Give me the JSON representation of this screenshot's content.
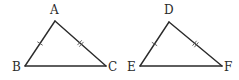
{
  "diagram": {
    "stroke_color": "#2a2a2a",
    "triangles": [
      {
        "name": "ABC",
        "vertices": [
          "A",
          "B",
          "C"
        ],
        "sides": [
          {
            "from": "A",
            "to": "B",
            "tick_marks": 1
          },
          {
            "from": "A",
            "to": "C",
            "tick_marks": 2
          },
          {
            "from": "B",
            "to": "C",
            "tick_marks": 0
          }
        ]
      },
      {
        "name": "DEF",
        "vertices": [
          "D",
          "E",
          "F"
        ],
        "sides": [
          {
            "from": "D",
            "to": "E",
            "tick_marks": 1
          },
          {
            "from": "D",
            "to": "F",
            "tick_marks": 2
          },
          {
            "from": "E",
            "to": "F",
            "tick_marks": 0
          }
        ]
      }
    ],
    "equal_sides": [
      [
        "AB",
        "DE"
      ],
      [
        "AC",
        "DF"
      ]
    ]
  }
}
